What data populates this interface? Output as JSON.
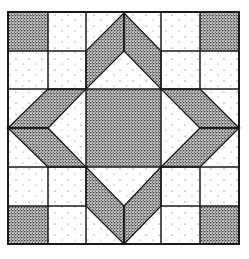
{
  "diagram": {
    "type": "quilt-block",
    "grid": {
      "columns": 6,
      "rows": 6
    },
    "colors": {
      "background": "#ffffff",
      "line": "#1a1a1a",
      "dark_fill": "#8a8a8a",
      "light_fill": "#ffffff"
    },
    "pieces": {
      "corner_squares": 4,
      "center_square": 1,
      "arrow_arms": 4,
      "light_squares": 12
    }
  }
}
